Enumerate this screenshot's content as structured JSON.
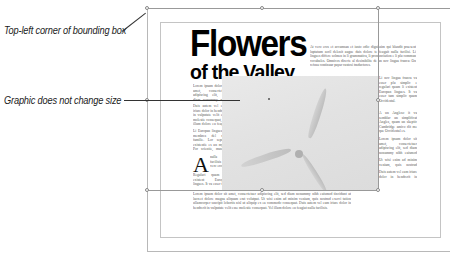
{
  "annotations": {
    "top_left_label": "Top-left corner of bounding box",
    "graphic_label": "Graphic does not change size"
  },
  "document": {
    "title_line1": "Flowers",
    "title_line2": "of the Valley",
    "drop_cap": "A",
    "left_column": [
      "Lorem ipsum dolor sit amet, consectetuer adipiscing elit, sed diam nonummy nibh euismod tincidunt ut laoreet dolore magna aliquam erat volutpat. Ut wisi enim ad minim veniam, quis nostrud exerci tation.",
      "Duis autem vel eum iriure dolor in hendrerit in vulputate velit esse molestie consequat, vel illum dolore eu feugiat nulla facilisis at vero eros et accumsan.",
      "Li Europan lingues es membres del sam familie. Lor separat existentie es un myth. Por scientie, musica, sport etc, litot Europa usa li sam vocabular. Li lingues differe solmen in li grammatica.",
      "nulla facilisis at vero eros et accumsan et iusto odio dignissim qui blandit praesent luptatum zzril delenit augue duis.",
      "Regulari quam li existent Europan lingues. It va esser tam simplic quam Occidental in fact, it va esser Occidental."
    ],
    "bottom_paragraph": "Lorem ipsum dolor sit amet, consectetuer adipiscing elit, sed diam nonummy nibh euismod tincidunt ut laoreet dolore magna aliquam erat volutpat. Ut wisi enim ad minim veniam, quis nostrud exerci tation ullamcorper suscipit lobortis nisl ut aliquip ex ea commodo consequat. Duis autem vel eum iriure dolor in hendrerit in vulputate velit esse molestie consequat. Vel illum dolore eu feugiat nulla facilisis.",
    "right_top_paragraph": "At vero eros et accumsan et iusto odio dignissim qui blandit praesent luptatum zzril delenit augue duis dolore te feugait nulla facilisi. Li lingues differe solmen in li grammatica, li pronunciation e li plu commun vocabules. Omnicos directe al desirabilite de un nov lingua franca: On refusa continuar payar custosi traductores.",
    "right_column": [
      "Li nov lingua franca va esser plu simplic e regulari quam li existent Europan lingues. It va esser tam simplic quam Occidental.",
      "A un Angleso it va semblar un simplificat Angles, quam un skeptic Cambridge amico dit me que Occidental es.",
      "Lorem ipsum dolor sit amet, consectetuer adipiscing elit, sed diam nonummy nibh euismod tincidunt ut laoreet dolore.",
      "Ut wisi enim ad minim veniam, quis nostrud exerci tation ullamcorper suscipit lobortis nisl ut aliquip ex ea commodo consequat.",
      "Duis autem vel eum iriure dolor in hendrerit in vulputate velit esse molestie consequat, vel illum dolore eu feugiat nulla facilisis."
    ],
    "image_subject": "wind-turbine-photo"
  }
}
